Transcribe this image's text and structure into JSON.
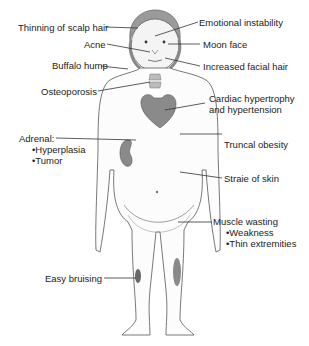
{
  "diagram": {
    "labels": {
      "thinning": "Thinning of scalp hair",
      "acne": "Acne",
      "buffalo": "Buffalo hump",
      "osteo": "Osteoporosis",
      "emotional": "Emotional instability",
      "moon": "Moon face",
      "facial_hair": "Increased facial hair",
      "cardiac1": "Cardiac hypertrophy",
      "cardiac2": "and hypertension",
      "adrenal": "Adrenal:",
      "adrenal_b1": "Hyperplasia",
      "adrenal_b2": "Tumor",
      "truncal": "Truncal obesity",
      "striae": "Straie of skin",
      "muscle": "Muscle wasting",
      "muscle_b1": "Weakness",
      "muscle_b2": "Thin extremities",
      "bruising": "Easy bruising"
    },
    "colors": {
      "line": "#333333",
      "outline": "#555555",
      "organ": "#8a8a8a",
      "hair": "#9a9a9a"
    }
  }
}
